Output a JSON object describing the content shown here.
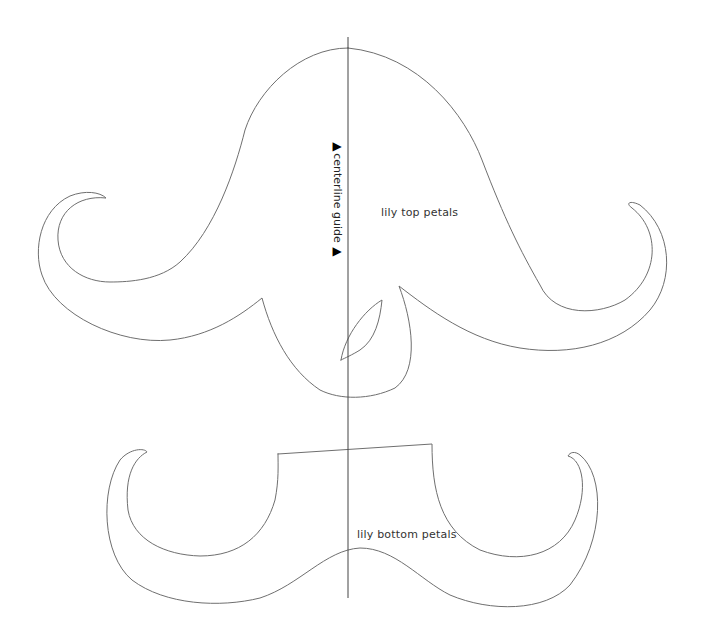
{
  "diagram": {
    "stroke_color": "#6f6f6f",
    "background": "#ffffff",
    "shapes": [
      {
        "id": "top-petals",
        "label": "lily top petals"
      },
      {
        "id": "bottom-petals",
        "label": "lily bottom petals"
      },
      {
        "id": "leaf-notch",
        "label": ""
      }
    ],
    "centerline": {
      "label": "centerline guide",
      "arrow_start": "▶",
      "arrow_end": "▶",
      "x": 348,
      "y_start": 37,
      "y_end": 598
    }
  }
}
